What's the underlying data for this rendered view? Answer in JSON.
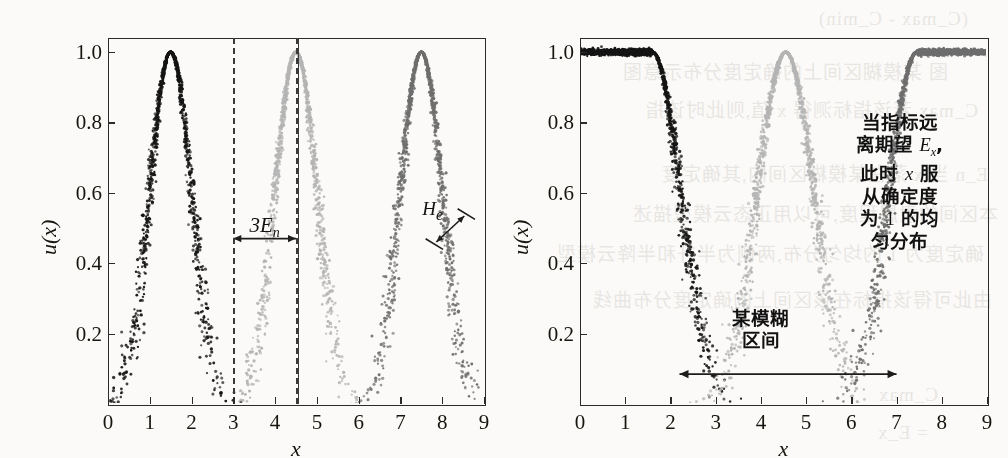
{
  "figure": {
    "kind": "scanned-textbook-figure",
    "panels": [
      {
        "id": "left",
        "axis": {
          "x_label": "x",
          "y_label": "u(x)",
          "x_ticks": [
            "0",
            "1",
            "2",
            "3",
            "4",
            "5",
            "6",
            "7",
            "8",
            "9"
          ],
          "y_ticks": [
            "0.2",
            "0.4",
            "0.6",
            "0.8",
            "1.0"
          ],
          "xlim": [
            0,
            9
          ],
          "ylim": [
            0,
            1.04
          ]
        },
        "annotations": [
          {
            "name": "three-en-span",
            "text": "3E",
            "sub": "n",
            "x_from": 3.0,
            "x_to": 4.5,
            "y": 0.47
          },
          {
            "name": "he-span",
            "text": "H",
            "sub": "e",
            "x": 8.05,
            "y": 0.5
          }
        ],
        "guides": [
          {
            "name": "dashed-line-left",
            "x": 3.0,
            "style": "dashed"
          },
          {
            "name": "dashed-line-mid",
            "x": 4.5,
            "style": "dashed"
          },
          {
            "name": "solid-line-mid",
            "x": 4.55,
            "style": "solid"
          }
        ]
      },
      {
        "id": "right",
        "axis": {
          "x_label": "x",
          "y_label": "u(x)",
          "x_ticks": [
            "0",
            "1",
            "2",
            "3",
            "4",
            "5",
            "6",
            "7",
            "8",
            "9"
          ],
          "y_ticks": [
            "0.2",
            "0.4",
            "0.6",
            "0.8",
            "1.0"
          ],
          "xlim": [
            0,
            9
          ],
          "ylim": [
            0,
            1.04
          ]
        },
        "annotations": [
          {
            "name": "note-uniform-certainty",
            "lines": [
              "当指标远",
              "离期望 Ex,",
              "此时 x 服",
              "从确定度",
              "为 1 的均",
              "匀分布"
            ],
            "x": 7.0,
            "y": 0.78
          },
          {
            "name": "fuzzy-interval-label",
            "lines": [
              "某模糊",
              "区间"
            ],
            "x": 4.0,
            "y": 0.21
          },
          {
            "name": "fuzzy-interval-arrow",
            "x_from": 2.2,
            "x_to": 7.0,
            "y": 0.085
          }
        ]
      }
    ]
  },
  "chart_data": {
    "type": "scatter",
    "title": "",
    "xlabel": "x",
    "ylabel": "u(x)",
    "xlim": [
      0,
      9
    ],
    "ylim": [
      0,
      1.04
    ],
    "grid": false,
    "legend": "none",
    "panels": [
      {
        "panel": "left",
        "description": "Three normal cloud droplet groups (正态云), each a full bell-shaped cloud.",
        "series": [
          {
            "name": "cloud-1-dark",
            "color": "#151515",
            "Ex": 1.5,
            "En": 0.5,
            "He": 0.05,
            "n_points": 1200,
            "shape": "full-cloud"
          },
          {
            "name": "cloud-2-light",
            "color": "#b4b4b4",
            "Ex": 4.5,
            "En": 0.5,
            "He": 0.05,
            "n_points": 1200,
            "shape": "full-cloud"
          },
          {
            "name": "cloud-3-mid",
            "color": "#6e6e6e",
            "Ex": 7.5,
            "En": 0.5,
            "He": 0.05,
            "n_points": 1200,
            "shape": "full-cloud"
          }
        ]
      },
      {
        "panel": "right",
        "description": "Falling half-cloud, full middle cloud and rising half-cloud with certainty clamped to 1 outside.",
        "series": [
          {
            "name": "half-cloud-falling",
            "color": "#151515",
            "Ex": 1.6,
            "En": 0.62,
            "He": 0.06,
            "n_points": 1400,
            "shape": "half-cloud-right",
            "plateau_from": 0.0,
            "plateau_to": 1.6
          },
          {
            "name": "cloud-middle",
            "color": "#b4b4b4",
            "Ex": 4.55,
            "En": 0.62,
            "He": 0.06,
            "n_points": 1300,
            "shape": "full-cloud"
          },
          {
            "name": "half-cloud-rising",
            "color": "#6e6e6e",
            "Ex": 7.45,
            "En": 0.62,
            "He": 0.06,
            "n_points": 1400,
            "shape": "half-cloud-left",
            "plateau_from": 7.45,
            "plateau_to": 9.0
          }
        ]
      }
    ]
  },
  "background_bleed": {
    "note": "faint mirrored show-through of text printed on the reverse page",
    "lines": [
      "图  某模糊区间上的确定度分布示意图",
      "C_max 若该指标测得 x 值,则此时该指",
      "(C_max - C_min)",
      "E_n  当 x 落在某模糊区间内,其确定度",
      "本区间的隶属程度,可以用正态云模型描述",
      "确定度为 1 的均匀分布,两侧为半升和半降云模型",
      "由此可得该指标在该区间上的确定度分布曲线",
      "C_max",
      "= E_x"
    ]
  },
  "colors": {
    "paper": "#fbfaf8",
    "ink": "#17150f",
    "cloud_dark": "#151515",
    "cloud_light": "#b4b4b4",
    "cloud_mid": "#6e6e6e",
    "frame": "#2b2b2b"
  }
}
